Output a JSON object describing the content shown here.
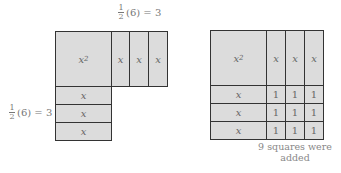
{
  "left_figure": {
    "top_label": {
      "num": "1",
      "den": "2",
      "rest": "(6) = 3"
    },
    "side_label": {
      "num": "1",
      "den": "2",
      "rest": "(6) = 3"
    },
    "square": {
      "var": "x",
      "exp": "2"
    },
    "right_strips": [
      "x",
      "x",
      "x"
    ],
    "bottom_strips": [
      "x",
      "x",
      "x"
    ]
  },
  "right_figure": {
    "square": {
      "var": "x",
      "exp": "2"
    },
    "right_strips": [
      "x",
      "x",
      "x"
    ],
    "bottom_strips": [
      "x",
      "x",
      "x"
    ],
    "unit_squares": [
      [
        "1",
        "1",
        "1"
      ],
      [
        "1",
        "1",
        "1"
      ],
      [
        "1",
        "1",
        "1"
      ]
    ],
    "caption_line1": "9 squares were",
    "caption_line2": "added"
  }
}
